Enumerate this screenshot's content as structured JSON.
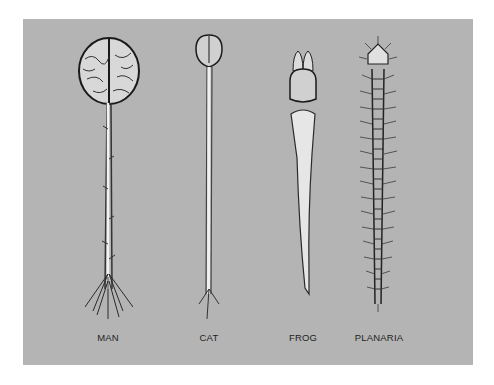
{
  "diagram": {
    "background_color": "#b4b4b4",
    "specimens": [
      {
        "id": "man",
        "label": "MAN",
        "structure": "large brain with long spinal cord and branching nerves"
      },
      {
        "id": "cat",
        "label": "CAT",
        "structure": "small brain with long thin spinal cord"
      },
      {
        "id": "frog",
        "label": "FROG",
        "structure": "lobed brain tapering to short spinal cord"
      },
      {
        "id": "planaria",
        "label": "PLANARIA",
        "structure": "ladder-like nerve cords with cross connections"
      }
    ]
  }
}
